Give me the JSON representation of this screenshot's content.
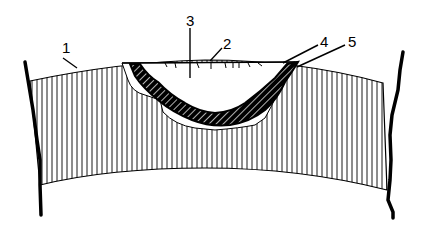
{
  "diagram": {
    "type": "cross-section",
    "labels": [
      {
        "id": "1",
        "text": "1",
        "x": 33,
        "y": 44
      },
      {
        "id": "2",
        "text": "2",
        "x": 223,
        "y": 38
      },
      {
        "id": "3",
        "text": "3",
        "x": 186,
        "y": 12
      },
      {
        "id": "4",
        "text": "4",
        "x": 320,
        "y": 36
      },
      {
        "id": "5",
        "text": "5",
        "x": 348,
        "y": 36
      }
    ],
    "colors": {
      "line": "#000000",
      "background": "#ffffff"
    }
  }
}
